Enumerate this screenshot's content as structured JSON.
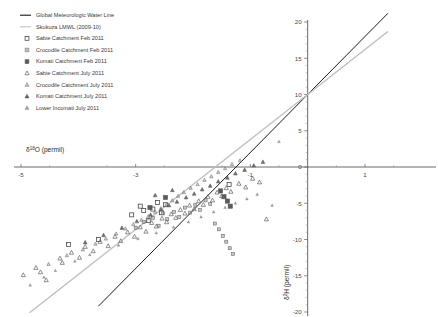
{
  "chart_data": {
    "type": "scatter",
    "title": "",
    "xlabel": "δ¹⁸O (permil)",
    "ylabel": "δ²H (permil)",
    "xlim": [
      -5.35,
      1.3
    ],
    "ylim": [
      -20,
      20
    ],
    "xticks": [
      -5,
      -3,
      -1,
      1
    ],
    "xtick_labels": [
      "-5",
      "-3",
      "-1",
      "1"
    ],
    "yticks": [
      20,
      15,
      10,
      5,
      0,
      -5,
      -10,
      -15,
      -20
    ],
    "ytick_labels": [
      "20",
      "15",
      "10",
      "5",
      "0",
      "-5",
      "-10",
      "-15",
      "-20"
    ],
    "grid": false,
    "legend_position": "top-left",
    "lines": [
      {
        "name": "Global Meteorologic Water Line",
        "color": "#1a1a1a",
        "style": "solid",
        "width": 1.0,
        "equation_intercept": 10.0,
        "slope": 8.0,
        "x_start": -3.65,
        "x_end": 1.4,
        "y_start": -19.2,
        "y_end": 21.2
      },
      {
        "name": "Skukuza LMWL (2009-10)",
        "color": "#bdbdbd",
        "style": "solid",
        "width": 1.3,
        "equation_intercept": 10.0,
        "slope": 6.2,
        "x_start": -4.85,
        "x_end": 1.4,
        "y_start": -20.1,
        "y_end": 18.7
      }
    ],
    "series": [
      {
        "name": "Sabie Catchment Feb 2011",
        "marker": "open-square",
        "color": "#4a4a4a",
        "fill": "none",
        "size": 4.0,
        "points": [
          [
            -4.17,
            -10.7
          ],
          [
            -3.65,
            -10.0
          ],
          [
            -3.07,
            -6.6
          ],
          [
            -2.92,
            -5.4
          ],
          [
            -2.86,
            -6.0
          ],
          [
            -2.78,
            -7.4
          ],
          [
            -2.7,
            -5.8
          ],
          [
            -2.62,
            -4.9
          ],
          [
            -2.55,
            -6.3
          ],
          [
            -2.48,
            -5.2
          ],
          [
            -1.37,
            -2.4
          ]
        ]
      },
      {
        "name": "Crocodile Catchment Feb 2011",
        "marker": "dotted-square",
        "color": "#6d6d6d",
        "fill": "#9a9a9a",
        "size": 3.0,
        "points": [
          [
            -3.0,
            -8.4
          ],
          [
            -2.86,
            -7.6
          ],
          [
            -2.7,
            -7.0
          ],
          [
            -2.6,
            -8.1
          ],
          [
            -2.52,
            -6.4
          ],
          [
            -2.45,
            -7.2
          ],
          [
            -2.33,
            -6.2
          ],
          [
            -2.24,
            -6.9
          ],
          [
            -2.14,
            -5.6
          ],
          [
            -2.05,
            -6.3
          ],
          [
            -1.96,
            -5.2
          ],
          [
            -1.88,
            -5.9
          ],
          [
            -1.78,
            -4.6
          ],
          [
            -1.7,
            -5.1
          ],
          [
            -1.62,
            -7.8
          ],
          [
            -1.55,
            -8.6
          ],
          [
            -1.48,
            -9.5
          ],
          [
            -1.42,
            -10.3
          ],
          [
            -1.36,
            -11.2
          ],
          [
            -1.3,
            -12.0
          ]
        ]
      },
      {
        "name": "Komati Catchment Feb 2011",
        "marker": "filled-square",
        "color": "#5a5a5a",
        "fill": "#5a5a5a",
        "size": 4.2,
        "points": [
          [
            -2.48,
            -4.2
          ],
          [
            -1.52,
            -3.3
          ],
          [
            -1.46,
            -4.1
          ],
          [
            -1.4,
            -4.7
          ],
          [
            -1.35,
            -5.4
          ],
          [
            -2.75,
            -5.6
          ]
        ]
      },
      {
        "name": "Sabie Catchment July 2011",
        "marker": "open-triangle",
        "color": "#6a6a6a",
        "fill": "none",
        "size": 3.6,
        "points": [
          [
            -4.96,
            -14.9
          ],
          [
            -4.74,
            -13.9
          ],
          [
            -4.66,
            -14.5
          ],
          [
            -4.56,
            -15.6
          ],
          [
            -4.32,
            -12.6
          ],
          [
            -4.28,
            -13.2
          ],
          [
            -4.12,
            -11.8
          ],
          [
            -3.98,
            -12.5
          ],
          [
            -3.88,
            -11.0
          ],
          [
            -3.74,
            -11.6
          ],
          [
            -3.62,
            -10.3
          ],
          [
            -3.48,
            -10.9
          ],
          [
            -3.36,
            -9.6
          ],
          [
            -3.26,
            -10.2
          ],
          [
            -3.14,
            -9.0
          ],
          [
            -3.02,
            -9.6
          ],
          [
            -2.92,
            -8.3
          ],
          [
            -2.82,
            -8.9
          ],
          [
            -2.72,
            -7.7
          ],
          [
            -2.64,
            -8.2
          ],
          [
            -2.54,
            -7.1
          ],
          [
            -2.46,
            -7.6
          ],
          [
            -2.38,
            -6.5
          ],
          [
            -2.3,
            -7.0
          ],
          [
            -2.22,
            -5.9
          ],
          [
            -2.14,
            -6.4
          ],
          [
            -2.06,
            -5.3
          ],
          [
            -1.98,
            -5.8
          ],
          [
            -1.9,
            -4.7
          ],
          [
            -1.82,
            -5.2
          ],
          [
            -1.74,
            -4.1
          ],
          [
            -1.66,
            -4.6
          ],
          [
            -1.58,
            -3.5
          ],
          [
            -1.5,
            -4.0
          ],
          [
            -1.42,
            -2.9
          ],
          [
            -1.34,
            -3.4
          ],
          [
            -1.2,
            -2.3
          ],
          [
            -1.08,
            -2.8
          ],
          [
            -0.96,
            -1.6
          ],
          [
            -0.84,
            -2.1
          ],
          [
            -0.72,
            -7.2
          ]
        ]
      },
      {
        "name": "Crocodile Catchment July 2011",
        "marker": "small-triangle",
        "color": "#7b7b7b",
        "fill": "#a8a8a8",
        "size": 3.0,
        "points": [
          [
            -4.52,
            -13.4
          ],
          [
            -4.2,
            -12.2
          ],
          [
            -3.92,
            -11.4
          ],
          [
            -3.7,
            -10.6
          ],
          [
            -3.52,
            -9.9
          ],
          [
            -3.34,
            -9.2
          ],
          [
            -3.18,
            -8.5
          ],
          [
            -3.04,
            -7.9
          ],
          [
            -2.9,
            -7.3
          ],
          [
            -2.78,
            -6.8
          ],
          [
            -2.66,
            -6.2
          ],
          [
            -2.56,
            -5.7
          ],
          [
            -2.46,
            -5.1
          ],
          [
            -2.36,
            -4.6
          ],
          [
            -2.26,
            -4.0
          ],
          [
            -2.16,
            -3.5
          ],
          [
            -2.04,
            -2.9
          ],
          [
            -1.92,
            -2.4
          ],
          [
            -1.8,
            -1.8
          ],
          [
            -1.68,
            -1.3
          ],
          [
            -1.56,
            -0.7
          ],
          [
            -1.44,
            -0.2
          ],
          [
            -1.32,
            0.4
          ],
          [
            -1.18,
            0.9
          ]
        ]
      },
      {
        "name": "Komati Catchment July 2011",
        "marker": "filled-triangle",
        "color": "#5e5e5e",
        "fill": "#6e6e6e",
        "size": 3.4,
        "points": [
          [
            -3.88,
            -10.4
          ],
          [
            -3.56,
            -9.4
          ],
          [
            -3.24,
            -8.4
          ],
          [
            -2.98,
            -7.5
          ],
          [
            -2.74,
            -6.6
          ],
          [
            -2.56,
            -5.9
          ],
          [
            -2.42,
            -5.3
          ],
          [
            -2.28,
            -4.8
          ],
          [
            -2.12,
            -4.2
          ],
          [
            -1.98,
            -3.7
          ],
          [
            -1.84,
            -3.1
          ],
          [
            -1.7,
            -2.6
          ],
          [
            -1.56,
            -2.0
          ],
          [
            -1.4,
            -1.5
          ],
          [
            -1.26,
            -0.9
          ],
          [
            -1.1,
            -0.4
          ],
          [
            -0.94,
            0.2
          ],
          [
            -0.78,
            0.7
          ],
          [
            -2.66,
            -3.9
          ],
          [
            -2.36,
            -3.2
          ]
        ]
      },
      {
        "name": "Lower Incomati July 2011",
        "marker": "tiny-triangle",
        "color": "#8c8c8c",
        "fill": "#8c8c8c",
        "size": 2.4,
        "points": [
          [
            -4.84,
            -16.3
          ],
          [
            -4.6,
            -15.2
          ],
          [
            -4.4,
            -14.3
          ],
          [
            -4.06,
            -13.0
          ],
          [
            -3.8,
            -12.1
          ],
          [
            -3.3,
            -10.8
          ],
          [
            -2.96,
            -9.9
          ],
          [
            -2.64,
            -9.1
          ],
          [
            -2.34,
            -8.3
          ],
          [
            -2.08,
            -7.6
          ],
          [
            -1.86,
            -6.9
          ],
          [
            -1.64,
            -6.2
          ],
          [
            -1.44,
            -5.6
          ],
          [
            -1.26,
            -5.0
          ],
          [
            -1.06,
            -4.4
          ],
          [
            -0.88,
            -3.8
          ],
          [
            -0.62,
            -5.3
          ],
          [
            -0.5,
            3.5
          ]
        ]
      }
    ]
  },
  "legend": {
    "items": [
      {
        "label": "Global Meteorologic  Water Line",
        "marker": "line",
        "color": "#1a1a1a"
      },
      {
        "label": "Skukuza LMWL (2009-10)",
        "marker": "line",
        "color": "#c2c2c2"
      },
      {
        "label": "Sabie Catchment Feb 2011",
        "marker": "open-square",
        "color": "#4a4a4a"
      },
      {
        "label": "Crocodile Catchment Feb 2011",
        "marker": "dotted-square",
        "color": "#8a8a8a"
      },
      {
        "label": "Komati Catchment Feb 2011",
        "marker": "filled-square",
        "color": "#5a5a5a"
      },
      {
        "label": "Sabie Catchment July 2011",
        "marker": "open-triangle",
        "color": "#6a6a6a"
      },
      {
        "label": "Crocodile Catchment July 2011",
        "marker": "small-triangle",
        "color": "#8a8a8a"
      },
      {
        "label": "Komati Catchment July 2011",
        "marker": "filled-triangle",
        "color": "#5e5e5e"
      },
      {
        "label": "Lower Incomati July 2011",
        "marker": "tiny-triangle",
        "color": "#8c8c8c"
      }
    ]
  }
}
